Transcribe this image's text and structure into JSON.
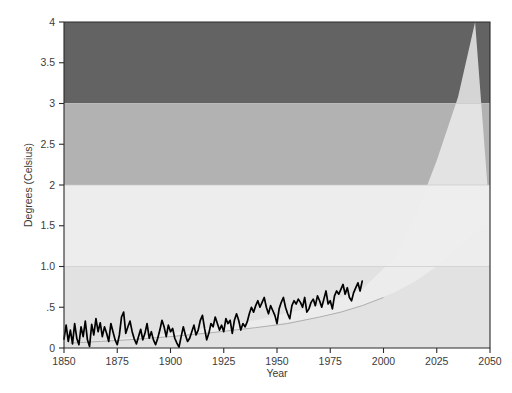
{
  "chart_data": {
    "type": "area",
    "title": "",
    "subtitle": "",
    "xlabel": "Year",
    "ylabel": "Degrees (Celsius)",
    "xlim": [
      1850,
      2050
    ],
    "ylim": [
      0,
      4
    ],
    "grid": false,
    "legend_position": "none",
    "x_ticks": [
      1850,
      1875,
      1900,
      1925,
      1950,
      1975,
      2000,
      2025,
      2050
    ],
    "x_tick_labels": [
      "1850",
      "1875",
      "1900",
      "1925",
      "1950",
      "1975",
      "2000",
      "2025",
      "2050"
    ],
    "y_ticks": [
      0,
      0.5,
      1.0,
      1.5,
      2,
      2.5,
      3,
      3.5,
      4
    ],
    "y_tick_labels": [
      "0",
      ".5",
      "1.0",
      "1.5",
      "2",
      "2.5",
      "3",
      "3.5",
      "4"
    ],
    "bands": [
      {
        "name": "band-0-1",
        "from": 0,
        "to": 1,
        "color": "#e2e2e2"
      },
      {
        "name": "band-1-2",
        "from": 1,
        "to": 2,
        "color": "#ededed"
      },
      {
        "name": "band-2-3",
        "from": 2,
        "to": 3,
        "color": "#b2b2b2"
      },
      {
        "name": "band-3-4",
        "from": 3,
        "to": 4,
        "color": "#636363"
      }
    ],
    "projection_cone": {
      "name": "projection-cone",
      "color": "#eeeeee",
      "opacity": 0.82,
      "apex_x": 1853,
      "apex_y": 0.06,
      "upper_bound": [
        [
          1853,
          0.06
        ],
        [
          1900,
          0.18
        ],
        [
          1940,
          0.34
        ],
        [
          1970,
          0.52
        ],
        [
          1990,
          0.72
        ],
        [
          2005,
          1.1
        ],
        [
          2015,
          1.62
        ],
        [
          2025,
          2.3
        ],
        [
          2035,
          3.08
        ],
        [
          2043,
          4.0
        ]
      ],
      "lower_bound": [
        [
          1853,
          0.06
        ],
        [
          1900,
          0.14
        ],
        [
          1940,
          0.25
        ],
        [
          1970,
          0.38
        ],
        [
          1990,
          0.52
        ],
        [
          2005,
          0.68
        ],
        [
          2015,
          0.82
        ],
        [
          2025,
          1.0
        ],
        [
          2035,
          1.22
        ],
        [
          2050,
          1.58
        ]
      ]
    },
    "trend_curve": {
      "name": "trend-curve",
      "points": [
        [
          1853,
          0.06
        ],
        [
          1880,
          0.1
        ],
        [
          1900,
          0.14
        ],
        [
          1920,
          0.19
        ],
        [
          1940,
          0.25
        ],
        [
          1955,
          0.3
        ],
        [
          1970,
          0.38
        ],
        [
          1980,
          0.44
        ],
        [
          1990,
          0.52
        ],
        [
          2000,
          0.62
        ]
      ]
    },
    "series": [
      {
        "name": "Observed global temperature anomaly",
        "color": "#000000",
        "x": [
          1850,
          1851,
          1852,
          1853,
          1854,
          1855,
          1856,
          1857,
          1858,
          1859,
          1860,
          1861,
          1862,
          1863,
          1864,
          1865,
          1866,
          1867,
          1868,
          1869,
          1870,
          1871,
          1872,
          1873,
          1874,
          1875,
          1876,
          1877,
          1878,
          1879,
          1880,
          1881,
          1882,
          1883,
          1884,
          1885,
          1886,
          1887,
          1888,
          1889,
          1890,
          1891,
          1892,
          1893,
          1894,
          1895,
          1896,
          1897,
          1898,
          1899,
          1900,
          1901,
          1902,
          1903,
          1904,
          1905,
          1906,
          1907,
          1908,
          1909,
          1910,
          1911,
          1912,
          1913,
          1914,
          1915,
          1916,
          1917,
          1918,
          1919,
          1920,
          1921,
          1922,
          1923,
          1924,
          1925,
          1926,
          1927,
          1928,
          1929,
          1930,
          1931,
          1932,
          1933,
          1934,
          1935,
          1936,
          1937,
          1938,
          1939,
          1940,
          1941,
          1942,
          1943,
          1944,
          1945,
          1946,
          1947,
          1948,
          1949,
          1950,
          1951,
          1952,
          1953,
          1954,
          1955,
          1956,
          1957,
          1958,
          1959,
          1960,
          1961,
          1962,
          1963,
          1964,
          1965,
          1966,
          1967,
          1968,
          1969,
          1970,
          1971,
          1972,
          1973,
          1974,
          1975,
          1976,
          1977,
          1978,
          1979,
          1980,
          1981,
          1982,
          1983,
          1984,
          1985,
          1986,
          1987,
          1988,
          1989,
          1990
        ],
        "y": [
          0.11,
          0.28,
          0.08,
          0.22,
          0.05,
          0.3,
          0.12,
          0.04,
          0.26,
          0.14,
          0.33,
          0.1,
          0.02,
          0.29,
          0.16,
          0.36,
          0.2,
          0.31,
          0.14,
          0.26,
          0.18,
          0.08,
          0.3,
          0.2,
          0.1,
          0.04,
          0.16,
          0.38,
          0.44,
          0.18,
          0.26,
          0.33,
          0.2,
          0.11,
          0.05,
          0.14,
          0.23,
          0.1,
          0.18,
          0.3,
          0.12,
          0.2,
          0.1,
          0.04,
          0.12,
          0.22,
          0.34,
          0.26,
          0.14,
          0.28,
          0.2,
          0.24,
          0.12,
          0.06,
          0.01,
          0.14,
          0.26,
          0.16,
          0.08,
          0.12,
          0.2,
          0.28,
          0.16,
          0.22,
          0.34,
          0.4,
          0.24,
          0.1,
          0.18,
          0.3,
          0.26,
          0.38,
          0.3,
          0.22,
          0.28,
          0.2,
          0.36,
          0.3,
          0.34,
          0.18,
          0.34,
          0.42,
          0.34,
          0.22,
          0.3,
          0.26,
          0.32,
          0.42,
          0.5,
          0.44,
          0.52,
          0.58,
          0.5,
          0.56,
          0.62,
          0.5,
          0.42,
          0.52,
          0.46,
          0.4,
          0.3,
          0.48,
          0.56,
          0.62,
          0.5,
          0.42,
          0.36,
          0.52,
          0.58,
          0.54,
          0.6,
          0.56,
          0.5,
          0.62,
          0.44,
          0.48,
          0.56,
          0.6,
          0.52,
          0.64,
          0.58,
          0.5,
          0.6,
          0.7,
          0.54,
          0.58,
          0.48,
          0.64,
          0.7,
          0.66,
          0.72,
          0.78,
          0.66,
          0.74,
          0.62,
          0.58,
          0.68,
          0.74,
          0.8,
          0.7,
          0.82
        ]
      }
    ]
  }
}
